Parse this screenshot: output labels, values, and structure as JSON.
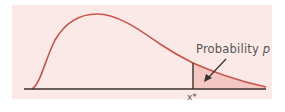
{
  "figure": {
    "panel_color": "#fbe9e7",
    "curve_color": "#c8544a",
    "shade_color": "#f3c7c2",
    "axis_color": "#3a3030",
    "annotation": {
      "label": "Probability p",
      "text": "Probability ",
      "variable": "p"
    },
    "x_marker": "x*"
  }
}
